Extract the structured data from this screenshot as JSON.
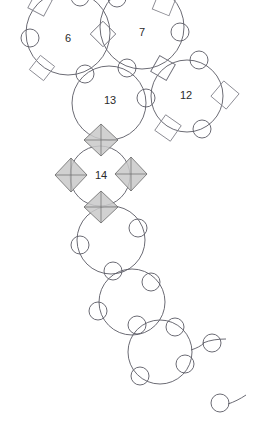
{
  "figure": {
    "canvas": {
      "width": 263,
      "height": 442,
      "background": "#ffffff"
    },
    "colors": {
      "ring_stroke": "#5a5a64",
      "node_circle_stroke": "#5a5a64",
      "node_square_stroke": "#8a8a92",
      "octahedron_fill": "#c9c9c9",
      "octahedron_stroke": "#6a6a6a",
      "label_text": "#2b2b2b"
    },
    "labels": [
      {
        "text": "6",
        "x": 68,
        "y": 39
      },
      {
        "text": "7",
        "x": 142,
        "y": 33
      },
      {
        "text": "13",
        "x": 110,
        "y": 101
      },
      {
        "text": "12",
        "x": 186,
        "y": 96
      },
      {
        "text": "14",
        "x": 101,
        "y": 176
      }
    ],
    "rings": [
      {
        "name": "ring-6",
        "label": "6",
        "cx": 68,
        "cy": 33,
        "r": 42
      },
      {
        "name": "ring-7",
        "label": "7",
        "cx": 142,
        "cy": 27,
        "r": 42
      },
      {
        "name": "ring-13",
        "label": "13",
        "cx": 109,
        "cy": 103,
        "r": 37
      },
      {
        "name": "ring-12",
        "label": "12",
        "cx": 187,
        "cy": 96,
        "r": 36
      },
      {
        "name": "ring-14",
        "label": "14",
        "cx": 100,
        "cy": 176,
        "r": 30
      },
      {
        "name": "ring-a",
        "label": "",
        "cx": 111,
        "cy": 240,
        "r": 34
      },
      {
        "name": "ring-b",
        "label": "",
        "cx": 132,
        "cy": 302,
        "r": 33
      },
      {
        "name": "ring-c",
        "label": "",
        "cx": 160,
        "cy": 352,
        "r": 32
      }
    ],
    "node_circles": [
      {
        "cx": 30,
        "cy": 38,
        "r": 9
      },
      {
        "cx": 80,
        "cy": -3,
        "r": 9
      },
      {
        "cx": 85,
        "cy": 74,
        "r": 9
      },
      {
        "cx": 117,
        "cy": -2,
        "r": 9
      },
      {
        "cx": 127,
        "cy": 68,
        "r": 9
      },
      {
        "cx": 180,
        "cy": 32,
        "r": 9
      },
      {
        "cx": 199,
        "cy": 60,
        "r": 9
      },
      {
        "cx": 146,
        "cy": 98,
        "r": 9
      },
      {
        "cx": 202,
        "cy": 129,
        "r": 9
      },
      {
        "cx": 138,
        "cy": 228,
        "r": 9
      },
      {
        "cx": 80,
        "cy": 245,
        "r": 9
      },
      {
        "cx": 113,
        "cy": 271,
        "r": 9
      },
      {
        "cx": 151,
        "cy": 282,
        "r": 9
      },
      {
        "cx": 98,
        "cy": 311,
        "r": 9
      },
      {
        "cx": 137,
        "cy": 325,
        "r": 9
      },
      {
        "cx": 175,
        "cy": 327,
        "r": 9
      },
      {
        "cx": 185,
        "cy": 364,
        "r": 9
      },
      {
        "cx": 140,
        "cy": 376,
        "r": 9
      },
      {
        "cx": 212,
        "cy": 343,
        "r": 9
      },
      {
        "cx": 220,
        "cy": 403,
        "r": 9
      }
    ],
    "node_squares": [
      {
        "cx": 42,
        "cy": 68,
        "size": 18,
        "rot": 38
      },
      {
        "cx": 40,
        "cy": 4,
        "size": 18,
        "rot": 28
      },
      {
        "cx": 103,
        "cy": 34,
        "size": 18,
        "rot": 45
      },
      {
        "cx": 164,
        "cy": 4,
        "size": 18,
        "rot": 22
      },
      {
        "cx": 163,
        "cy": 68,
        "size": 18,
        "rot": 30
      },
      {
        "cx": 225,
        "cy": 95,
        "size": 20,
        "rot": 40
      },
      {
        "cx": 168,
        "cy": 128,
        "size": 19,
        "rot": 35
      }
    ],
    "octahedra": [
      {
        "name": "octa-13-14-link",
        "cx": 101,
        "cy": 140,
        "rx": 17,
        "ry": 16
      },
      {
        "name": "octa-14-left",
        "cx": 71,
        "cy": 175,
        "rx": 16,
        "ry": 17
      },
      {
        "name": "octa-14-right",
        "cx": 131,
        "cy": 174,
        "rx": 16,
        "ry": 17
      },
      {
        "name": "octa-14-bottom",
        "cx": 101,
        "cy": 207,
        "rx": 17,
        "ry": 16
      }
    ],
    "tails": [
      {
        "name": "tail-upper-right",
        "d": "M 203 343 C 210 340 218 339 226 339"
      },
      {
        "name": "tail-lower-right",
        "d": "M 228 404 C 234 402 240 399 245 395"
      }
    ]
  }
}
